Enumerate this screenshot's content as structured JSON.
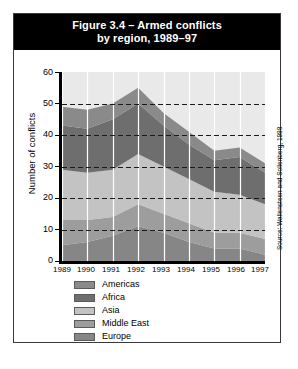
{
  "figure": {
    "title_line1": "Figure 3.4 – Armed conflicts",
    "title_line2": "by region, 1989–97",
    "source": "Source: Wallensteen and Sollenberg, 1998"
  },
  "axes": {
    "ylabel": "Number of conflicts",
    "yticks": [
      "0",
      "10",
      "20",
      "30",
      "40",
      "50",
      "60"
    ],
    "xticks": [
      "1989",
      "1990",
      "1991",
      "1992",
      "1993",
      "1994",
      "1995",
      "1996",
      "1997"
    ]
  },
  "legend": {
    "items": [
      {
        "label": "Americas",
        "color": "#8a8a8a"
      },
      {
        "label": "Africa",
        "color": "#6e6e6e"
      },
      {
        "label": "Asia",
        "color": "#c3c3c3"
      },
      {
        "label": "Middle East",
        "color": "#9d9d9d"
      },
      {
        "label": "Europe",
        "color": "#868686"
      }
    ]
  },
  "chart_data": {
    "type": "area",
    "title": "Figure 3.4 – Armed conflicts by region, 1989–97",
    "xlabel": "",
    "ylabel": "Number of conflicts",
    "ylim": [
      0,
      60
    ],
    "grid": true,
    "stacked": true,
    "legend_position": "bottom-left",
    "x": [
      "1989",
      "1990",
      "1991",
      "1992",
      "1993",
      "1994",
      "1995",
      "1996",
      "1997"
    ],
    "stack_order_bottom_to_top": [
      "Europe",
      "Middle East",
      "Asia",
      "Africa",
      "Americas"
    ],
    "series": [
      {
        "name": "Americas",
        "color": "#8a8a8a",
        "values": [
          6,
          6,
          5,
          5,
          4,
          4,
          3,
          3,
          3
        ]
      },
      {
        "name": "Africa",
        "color": "#6e6e6e",
        "values": [
          14,
          14,
          16,
          16,
          13,
          11,
          10,
          12,
          10
        ]
      },
      {
        "name": "Asia",
        "color": "#c3c3c3",
        "values": [
          16,
          15,
          15,
          16,
          15,
          14,
          13,
          12,
          11
        ]
      },
      {
        "name": "Middle East",
        "color": "#9d9d9d",
        "values": [
          8,
          7,
          6,
          7,
          6,
          6,
          5,
          5,
          5
        ]
      },
      {
        "name": "Europe",
        "color": "#868686",
        "values": [
          5,
          6,
          8,
          11,
          9,
          6,
          4,
          4,
          2
        ]
      }
    ],
    "totals": [
      49,
      48,
      50,
      55,
      47,
      41,
      35,
      36,
      31
    ]
  }
}
